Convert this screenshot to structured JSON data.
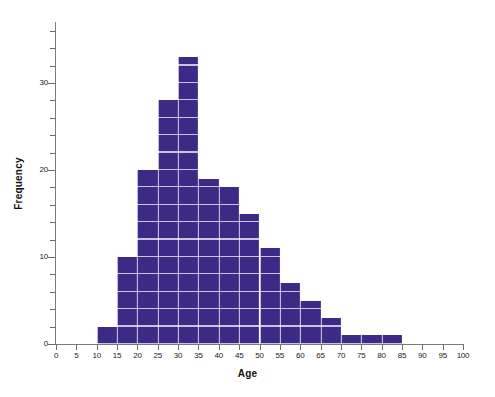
{
  "chart_data": {
    "type": "bar",
    "title": "",
    "xlabel": "Age",
    "ylabel": "Frequency",
    "xlim": [
      0,
      100
    ],
    "ylim": [
      0,
      37
    ],
    "grid": true,
    "legend": false,
    "bin_width": 5,
    "bar_color": "#3d2a87",
    "gridline_color": "#ffffff",
    "axis_color": "#7a7a7a",
    "categories": [
      "10-15",
      "15-20",
      "20-25",
      "25-30",
      "30-35",
      "35-40",
      "40-45",
      "45-50",
      "50-55",
      "55-60",
      "60-65",
      "65-70",
      "70-75",
      "75-80",
      "80-85"
    ],
    "bin_starts": [
      10,
      15,
      20,
      25,
      30,
      35,
      40,
      45,
      50,
      55,
      60,
      65,
      70,
      75,
      80
    ],
    "values": [
      2,
      10,
      20,
      28,
      33,
      19,
      18,
      15,
      11,
      7,
      5,
      3,
      1,
      1,
      1
    ],
    "x_ticks": [
      0,
      5,
      10,
      15,
      20,
      25,
      30,
      35,
      40,
      45,
      50,
      55,
      60,
      65,
      70,
      75,
      80,
      85,
      90,
      95,
      100
    ],
    "x_tick_labels": [
      "0",
      "5",
      "10",
      "15",
      "20",
      "25",
      "30",
      "35",
      "40",
      "45",
      "50",
      "55",
      "60",
      "65",
      "70",
      "75",
      "80",
      "85",
      "90",
      "95",
      "100"
    ],
    "y_ticks_major": [
      0,
      10,
      20,
      30
    ],
    "y_tick_labels_major": [
      "0",
      "10",
      "20",
      "30"
    ],
    "y_ticks_minor": [
      2,
      4,
      6,
      8,
      12,
      14,
      16,
      18,
      22,
      24,
      26,
      28,
      32,
      34,
      36
    ]
  }
}
